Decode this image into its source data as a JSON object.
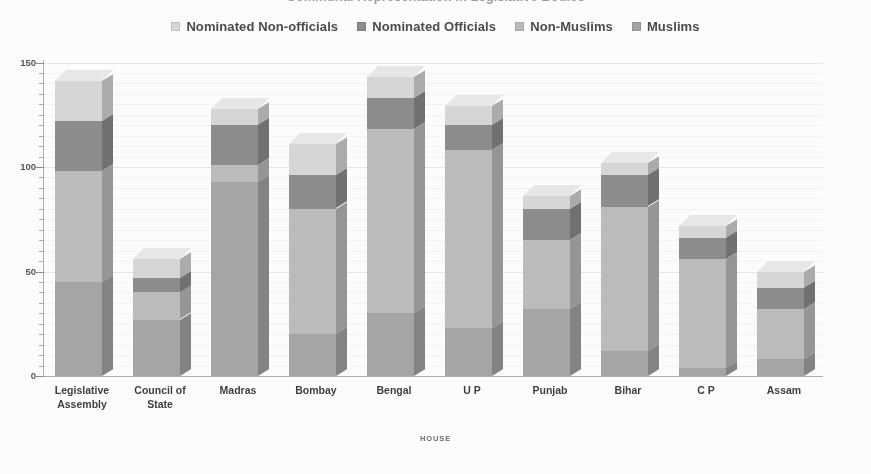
{
  "title": "Communal Representation in Legislative Bodies",
  "legend": {
    "position": "top",
    "items": [
      {
        "label": "Nominated Non-officials",
        "color": "#d7d7d7",
        "swatch": "legend-swatch-nominated-non-officials"
      },
      {
        "label": "Nominated Officials",
        "color": "#8d8d8d",
        "swatch": "legend-swatch-nominated-officials"
      },
      {
        "label": "Non-Muslims",
        "color": "#bcbcbc",
        "swatch": "legend-swatch-non-muslims"
      },
      {
        "label": "Muslims",
        "color": "#a5a5a5",
        "swatch": "legend-swatch-muslims"
      }
    ]
  },
  "axes": {
    "x_title": "HOUSE",
    "y_ticks": [
      "0",
      "50",
      "100",
      "150"
    ],
    "y_min": 0,
    "y_max": 150,
    "y_major_step": 50,
    "y_minor_step": 5
  },
  "chart_data": {
    "type": "bar",
    "stacked": true,
    "orientation": "vertical",
    "title": "Communal Representation in Legislative Bodies",
    "xlabel": "HOUSE",
    "ylabel": "",
    "ylim": [
      0,
      150
    ],
    "grid": true,
    "legend_position": "top",
    "categories": [
      "Legislative Assembly",
      "Council of State",
      "Madras",
      "Bombay",
      "Bengal",
      "U P",
      "Punjab",
      "Bihar",
      "C P",
      "Assam"
    ],
    "category_lines": [
      [
        "Legislative",
        "Assembly"
      ],
      [
        "Council of",
        "State"
      ],
      [
        "Madras",
        ""
      ],
      [
        "Bombay",
        ""
      ],
      [
        "Bengal",
        ""
      ],
      [
        "U P",
        ""
      ],
      [
        "Punjab",
        ""
      ],
      [
        "Bihar",
        ""
      ],
      [
        "C P",
        ""
      ],
      [
        "Assam",
        ""
      ]
    ],
    "series": [
      {
        "name": "Muslims",
        "color": "#a5a5a5",
        "values": [
          45,
          27,
          93,
          20,
          30,
          23,
          32,
          12,
          4,
          8
        ]
      },
      {
        "name": "Non-Muslims",
        "color": "#bcbcbc",
        "values": [
          53,
          13,
          8,
          60,
          88,
          85,
          33,
          69,
          52,
          24
        ]
      },
      {
        "name": "Nominated Officials",
        "color": "#8d8d8d",
        "values": [
          24,
          7,
          19,
          16,
          15,
          12,
          15,
          15,
          10,
          10
        ]
      },
      {
        "name": "Nominated Non-officials",
        "color": "#d7d7d7",
        "values": [
          19,
          9,
          8,
          15,
          10,
          9,
          6,
          6,
          6,
          8
        ]
      }
    ],
    "totals": [
      141,
      56,
      128,
      111,
      143,
      129,
      86,
      102,
      72,
      50
    ]
  }
}
